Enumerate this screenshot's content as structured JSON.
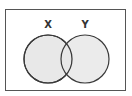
{
  "diagram": {
    "type": "venn",
    "universe": {
      "x": 5,
      "y": 9,
      "width": 121,
      "height": 82,
      "stroke": "#555555"
    },
    "sets": [
      {
        "label": "X",
        "cx": 48,
        "cy": 59,
        "r": 24,
        "label_x": 48,
        "label_y": 27
      },
      {
        "label": "Y",
        "cx": 85,
        "cy": 59,
        "r": 24,
        "label_x": 85,
        "label_y": 27
      }
    ],
    "colors": {
      "fill": "#e8e8e8",
      "stroke": "#3a3a3a",
      "background": "#ffffff"
    }
  }
}
